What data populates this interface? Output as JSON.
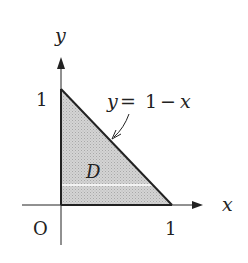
{
  "diagram": {
    "axes": {
      "x_label": "x",
      "y_label": "y",
      "origin_label": "O",
      "x_tick_label": "1",
      "y_tick_label": "1"
    },
    "region": {
      "label": "D",
      "description": "Triangle bounded by x = 0, y = 0, and y = 1 - x",
      "vertices": [
        [
          0,
          0
        ],
        [
          1,
          0
        ],
        [
          0,
          1
        ]
      ],
      "fill_color": "#c8c8c8"
    },
    "curve": {
      "equation_lhs": "y",
      "equation_eq": "=",
      "equation_rhs_num": "1",
      "equation_minus": "−",
      "equation_rhs_var": "x",
      "line_color": "#222222"
    },
    "strip": {
      "description": "Horizontal white strip across region",
      "color": "#ffffff"
    }
  }
}
